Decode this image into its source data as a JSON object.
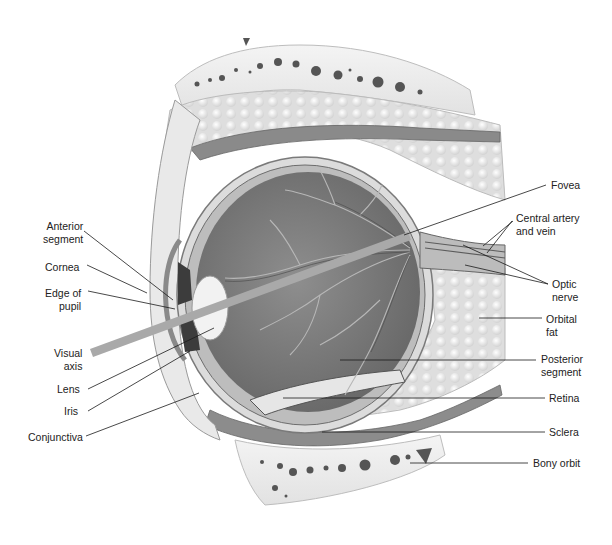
{
  "figure": {
    "colors": {
      "background": "#ffffff",
      "bone": "#efefef",
      "bone_pores": "#5a5a5a",
      "orbital_fat": "#e4e4e4",
      "muscle": "#8a8a8a",
      "vitreous": "#7d7d7d",
      "lens": "#f2f2f2",
      "iris": "#3c3c3c",
      "visual_axis": "#a9a9a9",
      "leader": "#1a1a1a",
      "text": "#222222"
    }
  },
  "labels_left": [
    {
      "id": "anterior-segment",
      "text": "Anterior\nsegment",
      "x": 43,
      "y": 220,
      "lx1": 84,
      "ly1": 231,
      "lx2": 173,
      "ly2": 300
    },
    {
      "id": "cornea",
      "text": "Cornea",
      "x": 45,
      "y": 261,
      "lx1": 87,
      "ly1": 265,
      "lx2": 147,
      "ly2": 293
    },
    {
      "id": "edge-of-pupil",
      "text": "Edge of\npupil",
      "x": 45,
      "y": 287,
      "lx1": 88,
      "ly1": 291,
      "lx2": 175,
      "ly2": 309
    },
    {
      "id": "visual-axis",
      "text": "Visual\naxis",
      "x": 54,
      "y": 347
    },
    {
      "id": "lens",
      "text": "Lens",
      "x": 57,
      "y": 383,
      "lx1": 88,
      "ly1": 389,
      "lx2": 214,
      "ly2": 328
    },
    {
      "id": "iris",
      "text": "Iris",
      "x": 64,
      "y": 405,
      "lx1": 88,
      "ly1": 411,
      "lx2": 190,
      "ly2": 351
    },
    {
      "id": "conjunctiva",
      "text": "Conjunctiva",
      "x": 28,
      "y": 431,
      "lx1": 86,
      "ly1": 436,
      "lx2": 199,
      "ly2": 393
    }
  ],
  "labels_right": [
    {
      "id": "fovea",
      "text": "Fovea",
      "x": 551,
      "y": 179,
      "lx1": 546,
      "ly1": 185,
      "lx2": 404,
      "ly2": 235
    },
    {
      "id": "central-artery-and-vein",
      "text": "Central artery\nand vein",
      "x": 516,
      "y": 212,
      "lx1": 513,
      "ly1": 221,
      "lx2": 483,
      "ly2": 246,
      "lx3": 512,
      "ly3": 221,
      "lx4": 487,
      "ly4": 253
    },
    {
      "id": "optic-nerve",
      "text": "Optic\nnerve",
      "x": 552,
      "y": 278,
      "lx1": 548,
      "ly1": 284,
      "lx2": 463,
      "ly2": 245,
      "lx3": 548,
      "ly3": 284,
      "lx4": 465,
      "ly4": 265
    },
    {
      "id": "orbital-fat",
      "text": "Orbital\nfat",
      "x": 546,
      "y": 313,
      "lx1": 542,
      "ly1": 318,
      "lx2": 479,
      "ly2": 318
    },
    {
      "id": "posterior-segment",
      "text": "Posterior\nsegment",
      "x": 541,
      "y": 353,
      "lx1": 536,
      "ly1": 360,
      "lx2": 340,
      "ly2": 360
    },
    {
      "id": "retina",
      "text": "Retina",
      "x": 549,
      "y": 392,
      "lx1": 545,
      "ly1": 398,
      "lx2": 283,
      "ly2": 398
    },
    {
      "id": "sclera",
      "text": "Sclera",
      "x": 549,
      "y": 426,
      "lx1": 545,
      "ly1": 432,
      "lx2": 322,
      "ly2": 432
    },
    {
      "id": "bony-orbit",
      "text": "Bony orbit",
      "x": 533,
      "y": 457,
      "lx1": 528,
      "ly1": 463,
      "lx2": 410,
      "ly2": 463
    }
  ]
}
